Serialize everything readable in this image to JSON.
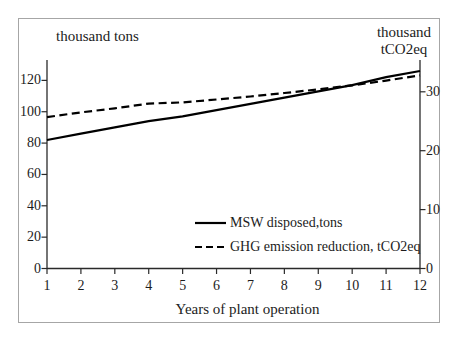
{
  "figure": {
    "background_color": "#ffffff",
    "border_color": "#a6a6a6",
    "text_color": "#1c1c1c",
    "axis_color": "#2a2a2a"
  },
  "chart_data": {
    "type": "line",
    "title": "",
    "x": [
      1,
      2,
      3,
      4,
      5,
      6,
      7,
      8,
      9,
      10,
      11,
      12
    ],
    "x_axis": {
      "label": "Years of plant operation",
      "ticks": [
        1,
        2,
        3,
        4,
        5,
        6,
        7,
        8,
        9,
        10,
        11,
        12
      ],
      "range": [
        1,
        12
      ]
    },
    "left_axis": {
      "label": "thousand tons",
      "ticks": [
        0,
        20,
        40,
        60,
        80,
        100,
        120
      ],
      "range": [
        0,
        133
      ]
    },
    "right_axis": {
      "label": "thousand tCO2eq",
      "label_lines": [
        "thousand",
        "tCO2eq"
      ],
      "ticks": [
        0,
        10,
        20,
        30
      ],
      "range": [
        0,
        35.4
      ]
    },
    "series": [
      {
        "name": "MSW disposed,tons",
        "axis": "left",
        "line_style": "solid",
        "color": "#000000",
        "values": [
          82,
          86,
          90,
          94,
          97,
          101,
          105,
          109,
          113,
          117,
          122,
          126
        ]
      },
      {
        "name": "GHG emission reduction, tCO2eq",
        "axis": "right",
        "line_style": "dashed",
        "color": "#000000",
        "values": [
          25.7,
          26.5,
          27.2,
          28.0,
          28.2,
          28.7,
          29.2,
          29.8,
          30.4,
          31.1,
          31.9,
          32.8
        ]
      }
    ],
    "legend": {
      "position": "inside-bottom-right",
      "entries": [
        "MSW disposed,tons",
        "GHG emission reduction, tCO2eq"
      ]
    },
    "grid": false
  }
}
